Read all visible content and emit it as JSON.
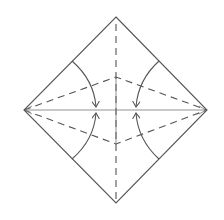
{
  "diagram": {
    "type": "origami-fold-diagram",
    "colors": {
      "stroke": "#555555",
      "background": "#ffffff"
    },
    "square": {
      "top": [
        116,
        17
      ],
      "right": [
        207,
        110
      ],
      "bottom": [
        116,
        203
      ],
      "left": [
        24,
        110
      ]
    },
    "center_crease": {
      "from": [
        116,
        22
      ],
      "to": [
        116,
        200
      ],
      "style": "dashed"
    },
    "horizontal_diagonal": {
      "from": [
        24,
        110
      ],
      "to": [
        207,
        110
      ],
      "style": "solid"
    },
    "kite_folds": {
      "top_point": [
        116,
        77
      ],
      "bottom_point": [
        116,
        144
      ],
      "style": "dashed"
    },
    "arrows": [
      {
        "name": "upper-left-fold-arrow",
        "from": [
          72,
          61
        ],
        "to": [
          96,
          107
        ]
      },
      {
        "name": "lower-left-fold-arrow",
        "from": [
          72,
          159
        ],
        "to": [
          96,
          113
        ]
      },
      {
        "name": "upper-right-fold-arrow",
        "from": [
          159,
          61
        ],
        "to": [
          136,
          107
        ]
      },
      {
        "name": "lower-right-fold-arrow",
        "from": [
          159,
          159
        ],
        "to": [
          136,
          113
        ]
      }
    ]
  }
}
